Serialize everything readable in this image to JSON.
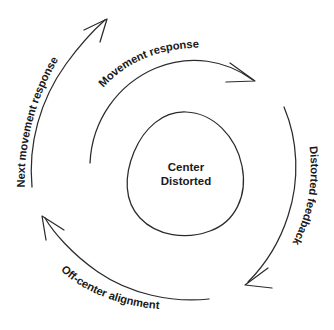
{
  "diagram": {
    "background_color": "#ffffff",
    "stroke_color": "#2b2b2b",
    "text_color": "#1a1a1a",
    "center": {
      "shape": "egg-blob",
      "line1": "Center",
      "line2": "Distorted"
    },
    "arcs": [
      {
        "id": "movement-response",
        "label": "Movement response",
        "position": "top",
        "direction": "clockwise",
        "arrowhead": "end-right"
      },
      {
        "id": "distorted-feedback",
        "label": "Distorted feedback",
        "position": "right",
        "direction": "clockwise",
        "arrowhead": "end-bottom-left"
      },
      {
        "id": "off-center-alignment",
        "label": "Off-center alignment",
        "position": "bottom",
        "direction": "clockwise",
        "arrowhead": "end-upper-left"
      },
      {
        "id": "next-movement-response",
        "label": "Next movement response",
        "position": "left",
        "direction": "clockwise",
        "arrowhead": "end-top-right"
      }
    ]
  }
}
